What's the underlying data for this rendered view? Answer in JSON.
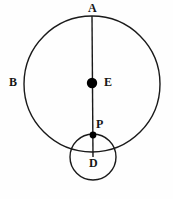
{
  "figure": {
    "background_color": "#fefefe",
    "stroke_color": "#1a1a1a",
    "dot_color": "#000000",
    "labels": {
      "top_point": "A",
      "left_point": "B",
      "center_point": "E",
      "tangency_point": "P",
      "small_circle_point": "D"
    },
    "shapes": {
      "large_circle": {
        "cx": 92,
        "cy": 84,
        "r": 68,
        "stroke_width": 1.4
      },
      "small_circle": {
        "cx": 93,
        "cy": 157,
        "r": 23,
        "stroke_width": 1.4
      },
      "diameter_line": {
        "x1": 92,
        "y1": 16,
        "x2": 93,
        "y2": 157,
        "stroke_width": 1.4
      },
      "dot_E": {
        "cx": 92,
        "cy": 83,
        "r": 5.2
      },
      "dot_P": {
        "cx": 93,
        "cy": 135,
        "r": 3.4
      }
    }
  }
}
